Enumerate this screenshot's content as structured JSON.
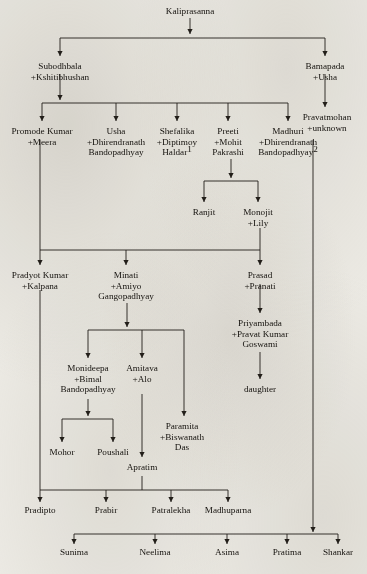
{
  "diagram": {
    "type": "family-tree",
    "ink_color": "#221e19",
    "paper_color": "#eceae4",
    "generations": 9,
    "footnote_markers": [
      "1",
      "2"
    ]
  },
  "nodes": [
    {
      "id": "kaliprasanna",
      "lines": [
        "Kaliprasanna"
      ],
      "x": 190,
      "y": 14,
      "generation": 1
    },
    {
      "id": "subodhbala",
      "lines": [
        "Subodhbala",
        "+Kshitibhushan"
      ],
      "x": 60,
      "y": 69,
      "generation": 2
    },
    {
      "id": "bamapada",
      "lines": [
        "Bamapada",
        "+Usha"
      ],
      "x": 325,
      "y": 69,
      "generation": 2
    },
    {
      "id": "pravatmohan",
      "lines": [
        "Pravatmohan",
        "+unknown"
      ],
      "x": 327,
      "y": 120,
      "generation": 3
    },
    {
      "id": "promode-kumar",
      "lines": [
        "Promode Kumar",
        "+Meera"
      ],
      "x": 42,
      "y": 134,
      "generation": 3
    },
    {
      "id": "usha",
      "lines": [
        "Usha",
        "+Dhirendranath",
        "Bandopadhyay"
      ],
      "x": 116,
      "y": 134,
      "generation": 3
    },
    {
      "id": "shefalika",
      "lines": [
        "Shefalika",
        "+Diptimoy",
        "Haldar"
      ],
      "superscript_on_last": "1",
      "x": 177,
      "y": 134,
      "generation": 3
    },
    {
      "id": "preeti",
      "lines": [
        "Preeti",
        "+Mohit",
        "Pakrashi"
      ],
      "x": 228,
      "y": 134,
      "generation": 3
    },
    {
      "id": "madhuri",
      "lines": [
        "Madhuri",
        "+Dhirendranath",
        "Bandopadhyay"
      ],
      "superscript_on_last": "2",
      "x": 288,
      "y": 134,
      "generation": 3
    },
    {
      "id": "ranjit",
      "lines": [
        "Ranjit"
      ],
      "x": 204,
      "y": 215,
      "generation": 4
    },
    {
      "id": "monojit",
      "lines": [
        "Monojit",
        "+Lily"
      ],
      "x": 258,
      "y": 215,
      "generation": 4
    },
    {
      "id": "pradyot-kumar",
      "lines": [
        "Pradyot Kumar",
        "+Kalpana"
      ],
      "x": 40,
      "y": 278,
      "generation": 4
    },
    {
      "id": "minati",
      "lines": [
        "Minati",
        "+Amiyo",
        "Gangopadhyay"
      ],
      "x": 126,
      "y": 278,
      "generation": 4
    },
    {
      "id": "prasad",
      "lines": [
        "Prasad",
        "+Pranati"
      ],
      "x": 260,
      "y": 278,
      "generation": 4
    },
    {
      "id": "priyambada",
      "lines": [
        "Priyambada",
        "+Pravat Kumar",
        "Goswami"
      ],
      "x": 260,
      "y": 326,
      "generation": 5
    },
    {
      "id": "monideepa",
      "lines": [
        "Monideepa",
        "+Bimal",
        "Bandopadhyay"
      ],
      "x": 88,
      "y": 371,
      "generation": 5
    },
    {
      "id": "amitava",
      "lines": [
        "Amitava",
        "+Alo"
      ],
      "x": 142,
      "y": 371,
      "generation": 5
    },
    {
      "id": "daughter",
      "lines": [
        "daughter"
      ],
      "x": 260,
      "y": 392,
      "generation": 6
    },
    {
      "id": "paramita",
      "lines": [
        "Paramita",
        "+Biswanath",
        "Das"
      ],
      "x": 182,
      "y": 429,
      "generation": 6
    },
    {
      "id": "mohor",
      "lines": [
        "Mohor"
      ],
      "x": 62,
      "y": 455,
      "generation": 6
    },
    {
      "id": "poushali",
      "lines": [
        "Poushali"
      ],
      "x": 113,
      "y": 455,
      "generation": 6
    },
    {
      "id": "apratim",
      "lines": [
        "Apratim"
      ],
      "x": 142,
      "y": 470,
      "generation": 6
    },
    {
      "id": "pradipto",
      "lines": [
        "Pradipto"
      ],
      "x": 40,
      "y": 513,
      "generation": 5
    },
    {
      "id": "prabir",
      "lines": [
        "Prabir"
      ],
      "x": 106,
      "y": 513,
      "generation": 5
    },
    {
      "id": "patralekha",
      "lines": [
        "Patralekha"
      ],
      "x": 171,
      "y": 513,
      "generation": 5
    },
    {
      "id": "madhuparna",
      "lines": [
        "Madhuparna"
      ],
      "x": 228,
      "y": 513,
      "generation": 5
    },
    {
      "id": "sunima",
      "lines": [
        "Sunima"
      ],
      "x": 74,
      "y": 555,
      "generation": 4
    },
    {
      "id": "neelima",
      "lines": [
        "Neelima"
      ],
      "x": 155,
      "y": 555,
      "generation": 4
    },
    {
      "id": "asima",
      "lines": [
        "Asima"
      ],
      "x": 227,
      "y": 555,
      "generation": 4
    },
    {
      "id": "pratima",
      "lines": [
        "Pratima"
      ],
      "x": 287,
      "y": 555,
      "generation": 4
    },
    {
      "id": "shankar",
      "lines": [
        "Shankar"
      ],
      "x": 338,
      "y": 555,
      "generation": 4
    }
  ],
  "edges": [
    {
      "id": "kali-stem",
      "from": "kaliprasanna",
      "path": "M190,18 L190,34"
    },
    {
      "id": "kali-bus",
      "from": "kaliprasanna",
      "path": "M60,38 L325,38"
    },
    {
      "id": "kali-to-subodh",
      "to": "subodhbala",
      "path": "M60,38 L60,56"
    },
    {
      "id": "kali-to-bamapada",
      "to": "bamapada",
      "path": "M325,38 L325,56"
    },
    {
      "id": "subodh-stem",
      "from": "subodhbala",
      "path": "M60,74 L60,100"
    },
    {
      "id": "subodh-bus",
      "from": "subodhbala",
      "path": "M42,103 L288,103"
    },
    {
      "id": "subodh-promode",
      "to": "promode-kumar",
      "path": "M42,103 L42,121"
    },
    {
      "id": "subodh-usha",
      "to": "usha",
      "path": "M116,103 L116,121"
    },
    {
      "id": "subodh-shefalika",
      "to": "shefalika",
      "path": "M177,103 L177,121"
    },
    {
      "id": "subodh-preeti",
      "to": "preeti",
      "path": "M228,103 L228,121"
    },
    {
      "id": "subodh-madhuri",
      "to": "madhuri",
      "path": "M288,103 L288,121"
    },
    {
      "id": "bamapada-stem",
      "to": "pravatmohan",
      "path": "M325,74 L325,107"
    },
    {
      "id": "preeti-stem",
      "from": "preeti",
      "path": "M231,159 L231,178"
    },
    {
      "id": "preeti-bus",
      "from": "preeti",
      "path": "M204,181 L258,181"
    },
    {
      "id": "preeti-ranjit",
      "to": "ranjit",
      "path": "M204,181 L204,202"
    },
    {
      "id": "preeti-monojit",
      "to": "monojit",
      "path": "M258,181 L258,202"
    },
    {
      "id": "promode-drop",
      "from": "promode-kumar",
      "path": "M40,140 L40,250"
    },
    {
      "id": "monojit-drop",
      "from": "monojit",
      "path": "M260,228 L260,250"
    },
    {
      "id": "gen4-bus",
      "from": "promode-kumar",
      "path": "M40,250 L260,250"
    },
    {
      "id": "gen4-pradyot",
      "to": "pradyot-kumar",
      "path": "M40,250 L40,265"
    },
    {
      "id": "gen4-minati",
      "to": "minati",
      "path": "M126,250 L126,265"
    },
    {
      "id": "gen4-prasad",
      "to": "prasad",
      "path": "M260,250 L260,265"
    },
    {
      "id": "minati-stem",
      "from": "minati",
      "path": "M127,303 L127,327"
    },
    {
      "id": "minati-bus",
      "from": "minati",
      "path": "M88,330 L184,330"
    },
    {
      "id": "minati-monideepa",
      "to": "monideepa",
      "path": "M88,330 L88,358"
    },
    {
      "id": "minati-amitava",
      "to": "amitava",
      "path": "M142,330 L142,358"
    },
    {
      "id": "minati-paramita",
      "to": "paramita",
      "path": "M184,330 L184,416"
    },
    {
      "id": "prasad-stem",
      "to": "priyambada",
      "path": "M260,284 L260,313"
    },
    {
      "id": "priyambada-stem",
      "to": "daughter",
      "path": "M260,352 L260,379"
    },
    {
      "id": "monideepa-stem",
      "from": "monideepa",
      "path": "M88,399 L88,416"
    },
    {
      "id": "monideepa-bus",
      "from": "monideepa",
      "path": "M62,419 L113,419"
    },
    {
      "id": "monideepa-mohor",
      "to": "mohor",
      "path": "M62,419 L62,442"
    },
    {
      "id": "monideepa-poush",
      "to": "poushali",
      "path": "M113,419 L113,442"
    },
    {
      "id": "amitava-stem",
      "to": "apratim",
      "path": "M142,394 L142,457"
    },
    {
      "id": "pradyot-drop",
      "from": "pradyot-kumar",
      "path": "M40,290 L40,490"
    },
    {
      "id": "apratim-drop",
      "from": "apratim",
      "path": "M142,476 L142,490"
    },
    {
      "id": "gen5-bus",
      "from": "pradyot-kumar",
      "path": "M40,490 L228,490"
    },
    {
      "id": "gen5-pradipto",
      "to": "pradipto",
      "path": "M40,490 L40,502"
    },
    {
      "id": "gen5-prabir",
      "to": "prabir",
      "path": "M106,490 L106,502"
    },
    {
      "id": "gen5-patralekha",
      "to": "patralekha",
      "path": "M171,490 L171,502"
    },
    {
      "id": "gen5-madhuparna",
      "to": "madhuparna",
      "path": "M228,490 L228,502"
    },
    {
      "id": "pravat-drop",
      "from": "pravatmohan",
      "path": "M313,140 L313,524"
    },
    {
      "id": "pravat-arrow",
      "from": "pravatmohan",
      "path": "M313,524 L313,532"
    },
    {
      "id": "gen6-bus",
      "from": "pravatmohan",
      "path": "M74,534 L338,534"
    },
    {
      "id": "gen6-sunima",
      "to": "sunima",
      "path": "M74,534 L74,544"
    },
    {
      "id": "gen6-neelima",
      "to": "neelima",
      "path": "M155,534 L155,544"
    },
    {
      "id": "gen6-asima",
      "to": "asima",
      "path": "M227,534 L227,544"
    },
    {
      "id": "gen6-pratima",
      "to": "pratima",
      "path": "M287,534 L287,544"
    },
    {
      "id": "gen6-shankar",
      "to": "shankar",
      "path": "M338,534 L338,544"
    }
  ],
  "arrows": [
    {
      "id": "arrow-kaliprasanna-down",
      "x": 190,
      "y": 34
    },
    {
      "id": "arrow-subodhbala",
      "x": 60,
      "y": 56
    },
    {
      "id": "arrow-bamapada",
      "x": 325,
      "y": 56
    },
    {
      "id": "arrow-subodh-down",
      "x": 60,
      "y": 100
    },
    {
      "id": "arrow-pravatmohan",
      "x": 325,
      "y": 107
    },
    {
      "id": "arrow-promode-kumar",
      "x": 42,
      "y": 121
    },
    {
      "id": "arrow-usha",
      "x": 116,
      "y": 121
    },
    {
      "id": "arrow-shefalika",
      "x": 177,
      "y": 121
    },
    {
      "id": "arrow-preeti",
      "x": 228,
      "y": 121
    },
    {
      "id": "arrow-madhuri",
      "x": 288,
      "y": 121
    },
    {
      "id": "arrow-preeti-down",
      "x": 231,
      "y": 178
    },
    {
      "id": "arrow-ranjit",
      "x": 204,
      "y": 202
    },
    {
      "id": "arrow-monojit",
      "x": 258,
      "y": 202
    },
    {
      "id": "arrow-pradyot-kumar",
      "x": 40,
      "y": 265
    },
    {
      "id": "arrow-minati",
      "x": 126,
      "y": 265
    },
    {
      "id": "arrow-prasad",
      "x": 260,
      "y": 265
    },
    {
      "id": "arrow-minati-down",
      "x": 127,
      "y": 327
    },
    {
      "id": "arrow-priyambada",
      "x": 260,
      "y": 313
    },
    {
      "id": "arrow-monideepa",
      "x": 88,
      "y": 358
    },
    {
      "id": "arrow-amitava",
      "x": 142,
      "y": 358
    },
    {
      "id": "arrow-daughter",
      "x": 260,
      "y": 379
    },
    {
      "id": "arrow-paramita",
      "x": 184,
      "y": 416
    },
    {
      "id": "arrow-monideepa-down",
      "x": 88,
      "y": 416
    },
    {
      "id": "arrow-mohor",
      "x": 62,
      "y": 442
    },
    {
      "id": "arrow-poushali",
      "x": 113,
      "y": 442
    },
    {
      "id": "arrow-apratim",
      "x": 142,
      "y": 457
    },
    {
      "id": "arrow-pradipto",
      "x": 40,
      "y": 502
    },
    {
      "id": "arrow-prabir",
      "x": 106,
      "y": 502
    },
    {
      "id": "arrow-patralekha",
      "x": 171,
      "y": 502
    },
    {
      "id": "arrow-madhuparna",
      "x": 228,
      "y": 502
    },
    {
      "id": "arrow-pravat-bus",
      "x": 313,
      "y": 532
    },
    {
      "id": "arrow-sunima",
      "x": 74,
      "y": 544
    },
    {
      "id": "arrow-neelima",
      "x": 155,
      "y": 544
    },
    {
      "id": "arrow-asima",
      "x": 227,
      "y": 544
    },
    {
      "id": "arrow-pratima",
      "x": 287,
      "y": 544
    },
    {
      "id": "arrow-shankar",
      "x": 338,
      "y": 544
    }
  ]
}
